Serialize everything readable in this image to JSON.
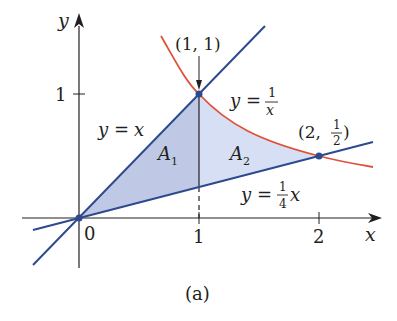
{
  "figure": {
    "caption": "(a)",
    "colors": {
      "line_blue": "#2e4a8f",
      "curve_red": "#e0503a",
      "fill_A1": "#b4bfe0",
      "fill_A2": "#d2dcf2",
      "axis": "#231f20"
    },
    "axes": {
      "x_label": "x",
      "y_label": "y",
      "origin_label": "0",
      "x_ticks": [
        "1",
        "2"
      ],
      "y_ticks": [
        "1"
      ]
    },
    "curves": [
      {
        "name": "y = x",
        "label_lhs": "y",
        "label_eq": "=",
        "label_rhs": "x"
      },
      {
        "name": "y = 1/x",
        "label_lhs": "y",
        "label_eq": "=",
        "label_num": "1",
        "label_den": "x"
      },
      {
        "name": "y = (1/4)x",
        "label_lhs": "y",
        "label_eq": "=",
        "label_num": "1",
        "label_den": "4",
        "label_var": "x"
      }
    ],
    "points": [
      {
        "label": "(1, 1)",
        "x": 1,
        "y": 1
      },
      {
        "label_prefix": "(2,",
        "label_num": "1",
        "label_den": "2",
        "label_suffix": ")",
        "x": 2,
        "y": 0.5
      },
      {
        "label": "0",
        "x": 0,
        "y": 0
      }
    ],
    "regions": [
      {
        "label": "A",
        "subscript": "1"
      },
      {
        "label": "A",
        "subscript": "2"
      }
    ]
  }
}
